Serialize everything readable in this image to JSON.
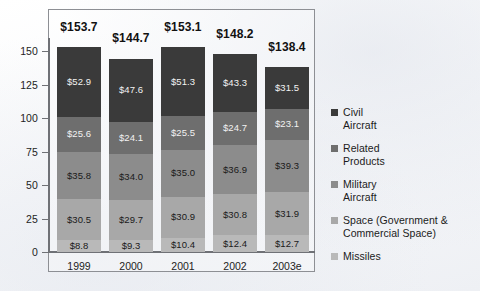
{
  "chart_data": {
    "type": "bar",
    "subtype": "stacked-vertical",
    "title": "",
    "xlabel": "",
    "ylabel": "",
    "ylim": [
      0,
      160
    ],
    "yticks": [
      "0",
      "25",
      "50",
      "75",
      "100",
      "125",
      "150"
    ],
    "grid": false,
    "legend_position": "right",
    "categories": [
      "1999",
      "2000",
      "2001",
      "2002",
      "2003e"
    ],
    "totals": [
      "$153.7",
      "$144.7",
      "$153.1",
      "$148.2",
      "$138.4"
    ],
    "totals_values": [
      153.7,
      144.7,
      153.1,
      148.2,
      138.4
    ],
    "series": [
      {
        "name": "Missiles",
        "color": "#b9b9b9",
        "values": [
          8.8,
          9.3,
          10.4,
          12.4,
          12.7
        ],
        "labels": [
          "$8.8",
          "$9.3",
          "$10.4",
          "$12.4",
          "$12.7"
        ],
        "label_color": "#1a1a1a"
      },
      {
        "name": "Space (Government & Commercial Space)",
        "color": "#a8a8a8",
        "values": [
          30.5,
          29.7,
          30.9,
          30.8,
          31.9
        ],
        "labels": [
          "$30.5",
          "$29.7",
          "$30.9",
          "$30.8",
          "$31.9"
        ],
        "label_color": "#1a1a1a"
      },
      {
        "name": "Military Aircraft",
        "color": "#8c8c8c",
        "values": [
          35.8,
          34.0,
          35.0,
          36.9,
          39.3
        ],
        "labels": [
          "$35.8",
          "$34.0",
          "$35.0",
          "$36.9",
          "$39.3"
        ],
        "label_color": "#1a1a1a"
      },
      {
        "name": "Related Products",
        "color": "#6e6e6e",
        "values": [
          25.6,
          24.1,
          25.5,
          24.7,
          23.1
        ],
        "labels": [
          "$25.6",
          "$24.1",
          "$25.5",
          "$24.7",
          "$23.1"
        ],
        "label_color": "#f2f2f2"
      },
      {
        "name": "Civil Aircraft",
        "color": "#3a3a3a",
        "values": [
          52.9,
          47.6,
          51.3,
          43.3,
          31.5
        ],
        "labels": [
          "$52.9",
          "$47.6",
          "$51.3",
          "$43.3",
          "$31.5"
        ],
        "label_color": "#f2f2f2"
      }
    ]
  },
  "legend": {
    "items": [
      {
        "swatch_color": "#3a3a3a",
        "line1": "Civil",
        "line2": "Aircraft"
      },
      {
        "swatch_color": "#6e6e6e",
        "line1": "Related",
        "line2": "Products"
      },
      {
        "swatch_color": "#8c8c8c",
        "line1": "Military",
        "line2": "Aircraft"
      },
      {
        "swatch_color": "#a8a8a8",
        "line1": "Space (Government &",
        "line2": "Commercial Space)"
      },
      {
        "swatch_color": "#b9b9b9",
        "line1": "Missiles",
        "line2": ""
      }
    ]
  }
}
